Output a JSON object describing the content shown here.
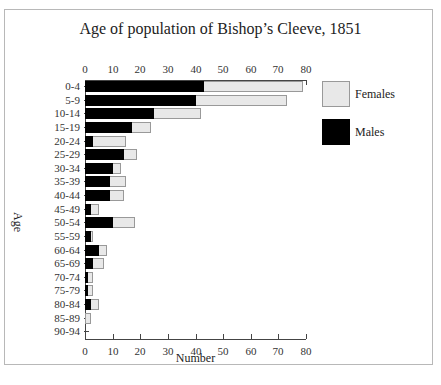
{
  "chart_data": {
    "type": "bar",
    "orientation": "horizontal",
    "stacked": true,
    "title": "Age of population of Bishop’s Cleeve, 1851",
    "xlabel": "Number",
    "ylabel": "Age",
    "xlim": [
      0,
      80
    ],
    "x_ticks": [
      0,
      10,
      20,
      30,
      40,
      50,
      60,
      70,
      80
    ],
    "x_axis_top_and_bottom": true,
    "grid": false,
    "legend_position": "right",
    "categories": [
      "0-4",
      "5-9",
      "10-14",
      "15-19",
      "20-24",
      "25-29",
      "30-34",
      "35-39",
      "40-44",
      "45-49",
      "50-54",
      "55-59",
      "60-64",
      "65-69",
      "70-74",
      "75-79",
      "80-84",
      "85-89",
      "90-94"
    ],
    "series": [
      {
        "name": "Males",
        "color": "#000000",
        "values": [
          43,
          40,
          25,
          17,
          3,
          14,
          10,
          9,
          9,
          2,
          10,
          2,
          5,
          3,
          1,
          1,
          2,
          0,
          0
        ]
      },
      {
        "name": "Females",
        "color": "#e8e8e8",
        "values": [
          36,
          33,
          17,
          7,
          12,
          5,
          3,
          6,
          5,
          3,
          8,
          1,
          3,
          4,
          2,
          2,
          3,
          2,
          0
        ]
      }
    ],
    "totals": [
      79,
      73,
      42,
      24,
      15,
      19,
      13,
      15,
      14,
      5,
      18,
      3,
      8,
      7,
      3,
      3,
      5,
      2,
      0
    ]
  },
  "legend": {
    "females": "Females",
    "males": "Males"
  }
}
